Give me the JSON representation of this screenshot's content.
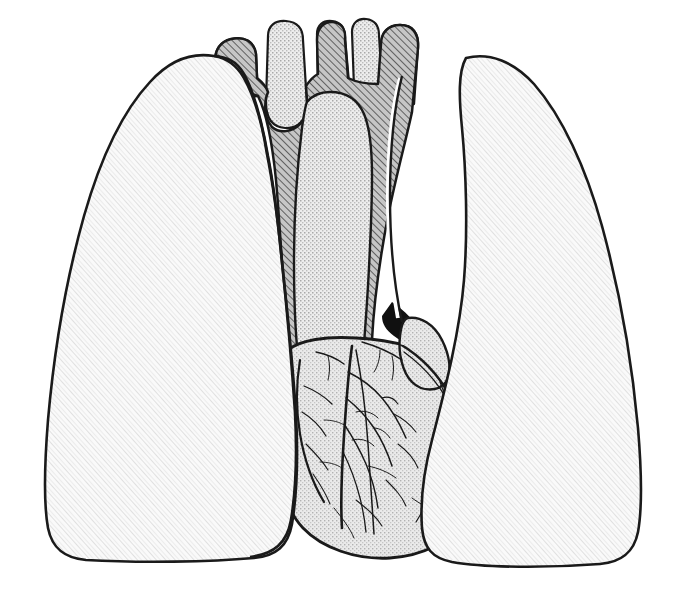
{
  "figure": {
    "domain": "line-art anatomical illustration",
    "canvas": {
      "width": 684,
      "height": 598
    },
    "background_color": "#ffffff",
    "outline_color": "#1a1a1a",
    "visible_text": []
  },
  "palette": {
    "paper": "#ffffff",
    "outline": "#1a1a1a",
    "lung_fill": "#f7f7f7",
    "lung_texture": "#d8d8d8",
    "vessel_hatch_fill": "#b9b9b9",
    "vessel_hatch_line": "#3a3a3a",
    "vessel_stipple_fill": "#e2e2e2",
    "vessel_stipple_dot": "#9a9a9a",
    "heart_fill": "#e6e6e6",
    "heart_stipple_dot": "#a8a8a8",
    "coronary_line": "#1a1a1a",
    "shadow_black": "#0d0d0d"
  },
  "structures": [
    {
      "id": "left-lung",
      "label": "Left lung (viewer's left)",
      "texture": "fine diagonal halftone",
      "fill": "#f7f7f7",
      "stroke_width": 2.6,
      "path": "M 214 56 C 190 52 168 62 150 82 C 122 112 100 160 84 216 C 66 280 54 352 48 420 C 44 470 44 506 48 528 C 52 548 64 558 86 560 C 140 563 210 562 254 558 C 276 556 288 546 292 524 C 297 494 298 452 296 414 C 292 352 286 300 282 262 C 278 222 274 186 268 156 C 262 122 254 92 244 74 C 236 60 226 57 214 56 Z"
    },
    {
      "id": "right-lung",
      "label": "Right lung (viewer's right)",
      "texture": "fine diagonal halftone",
      "fill": "#f7f7f7",
      "stroke_width": 2.6,
      "path": "M 466 58 C 490 52 514 62 534 84 C 562 116 586 168 602 226 C 620 292 632 362 638 428 C 642 476 642 510 638 532 C 634 552 622 562 600 564 C 548 568 486 568 452 562 C 432 558 424 548 422 528 C 420 500 424 470 432 440 C 446 386 460 330 464 280 C 468 230 466 170 462 128 C 459 98 458 72 466 58 Z"
    },
    {
      "id": "great-vessels-hatched",
      "label": "Trachea, aortic arch and brachiocephalic vessels (cross-hatched)",
      "texture": "diagonal hatch",
      "fill": "#b9b9b9",
      "stroke_width": 2.4
    },
    {
      "id": "pulmonary-trunk-stippled",
      "label": "Pulmonary trunk / superior vena cava (stippled)",
      "texture": "fine stipple",
      "fill": "#e2e2e2",
      "stroke_width": 2.4
    },
    {
      "id": "heart",
      "label": "Heart with coronary vessels",
      "texture": "fine stipple with drawn vessel branches",
      "fill": "#e6e6e6",
      "stroke_width": 2.8
    }
  ],
  "vessel_stumps": [
    {
      "id": "stump-1",
      "label": "left brachiocephalic / subclavian stump",
      "texture": "hatch",
      "x": 214,
      "y": 36
    },
    {
      "id": "stump-2",
      "label": "common carotid stump",
      "texture": "stipple",
      "x": 268,
      "y": 28
    },
    {
      "id": "stump-3",
      "label": "trachea stump",
      "texture": "hatch",
      "x": 318,
      "y": 26
    },
    {
      "id": "stump-4",
      "label": "right common carotid stump",
      "texture": "stipple",
      "x": 348,
      "y": 28
    },
    {
      "id": "stump-5",
      "label": "right brachiocephalic stump",
      "texture": "hatch",
      "x": 382,
      "y": 30
    }
  ],
  "coronary_branches": {
    "count": 34,
    "description": "Branching coronary arteries and cardiac veins drawn across the anterior heart surface"
  }
}
